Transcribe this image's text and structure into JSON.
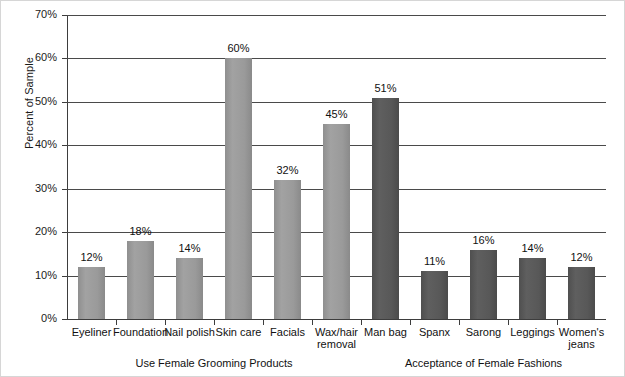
{
  "chart_data": {
    "type": "bar",
    "title": "",
    "xlabel": "",
    "ylabel": "Percent of Sample",
    "ylim": [
      0,
      70
    ],
    "ytick_labels": [
      "0%",
      "10%",
      "20%",
      "30%",
      "40%",
      "50%",
      "60%",
      "70%"
    ],
    "ytick_values": [
      0,
      10,
      20,
      30,
      40,
      50,
      60,
      70
    ],
    "grid": "horizontal",
    "legend": "none",
    "categories": [
      "Eyeliner",
      "Foundation",
      "Nail polish",
      "Skin care",
      "Facials",
      "Wax/hair removal",
      "Man bag",
      "Spanx",
      "Sarong",
      "Leggings",
      "Women's jeans"
    ],
    "values": [
      12,
      18,
      14,
      60,
      32,
      45,
      51,
      11,
      16,
      14,
      12
    ],
    "value_labels": [
      "12%",
      "18%",
      "14%",
      "60%",
      "32%",
      "45%",
      "51%",
      "11%",
      "16%",
      "14%",
      "12%"
    ],
    "bars": [
      {
        "label": "Eyeliner",
        "display_label": "Eyeliner",
        "value": 12,
        "value_label": "12%",
        "shade": "light",
        "group": "grooming"
      },
      {
        "label": "Foundation",
        "display_label": "Foundation",
        "value": 18,
        "value_label": "18%",
        "shade": "light",
        "group": "grooming"
      },
      {
        "label": "Nail polish",
        "display_label": "Nail polish",
        "value": 14,
        "value_label": "14%",
        "shade": "light",
        "group": "grooming"
      },
      {
        "label": "Skin care",
        "display_label": "Skin care",
        "value": 60,
        "value_label": "60%",
        "shade": "light",
        "group": "grooming"
      },
      {
        "label": "Facials",
        "display_label": "Facials",
        "value": 32,
        "value_label": "32%",
        "shade": "light",
        "group": "grooming"
      },
      {
        "label": "Wax/hair removal",
        "display_label": "Wax/hair\nremoval",
        "value": 45,
        "value_label": "45%",
        "shade": "light",
        "group": "grooming"
      },
      {
        "label": "Man bag",
        "display_label": "Man bag",
        "value": 51,
        "value_label": "51%",
        "shade": "dark",
        "group": "fashions"
      },
      {
        "label": "Spanx",
        "display_label": "Spanx",
        "value": 11,
        "value_label": "11%",
        "shade": "dark",
        "group": "fashions"
      },
      {
        "label": "Sarong",
        "display_label": "Sarong",
        "value": 16,
        "value_label": "16%",
        "shade": "dark",
        "group": "fashions"
      },
      {
        "label": "Leggings",
        "display_label": "Leggings",
        "value": 14,
        "value_label": "14%",
        "shade": "dark",
        "group": "fashions"
      },
      {
        "label": "Women's jeans",
        "display_label": "Women's\njeans",
        "value": 12,
        "value_label": "12%",
        "shade": "dark",
        "group": "fashions"
      }
    ],
    "group_labels": [
      {
        "text": "Use Female Grooming Products",
        "center_index_start": 0,
        "center_index_end": 5
      },
      {
        "text": "Acceptance of Female Fashions",
        "center_index_start": 6,
        "center_index_end": 10
      }
    ],
    "colors": {
      "bar_light": "#9a9a9a",
      "bar_dark": "#585858",
      "axis": "#3d3d3d",
      "gridline": "#4a4a4a",
      "text": "#111111",
      "background": "#ffffff"
    }
  }
}
